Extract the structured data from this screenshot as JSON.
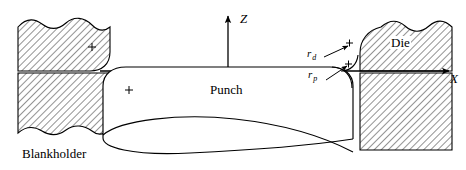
{
  "figure": {
    "type": "engineering-schematic",
    "background_color": "#ffffff",
    "line_color": "#000000",
    "hatch_color": "#000000",
    "width": 466,
    "height": 170
  },
  "axes": {
    "z_label": "Z",
    "x_label": "X",
    "origin_x": 228,
    "origin_y": 71,
    "z_tip_y": 14,
    "x_tip_x": 447
  },
  "parts": {
    "punch_label": "Punch",
    "die_label": "Die",
    "blankholder_label": "Blankholder"
  },
  "annotations": {
    "die_radius_symbol": "r",
    "die_radius_subscript": "d",
    "punch_radius_symbol": "r",
    "punch_radius_subscript": "p"
  },
  "center_marks": {
    "glyph": "+",
    "count": 4
  }
}
